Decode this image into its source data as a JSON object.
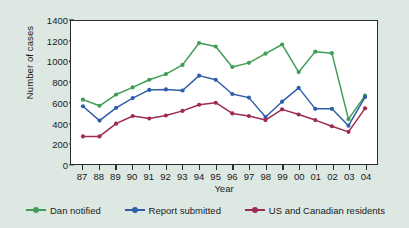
{
  "chart_data": {
    "type": "line",
    "title": "",
    "xlabel": "Year",
    "ylabel": "Number of cases",
    "categories": [
      "87",
      "88",
      "89",
      "90",
      "91",
      "92",
      "93",
      "94",
      "95",
      "96",
      "97",
      "98",
      "99",
      "00",
      "01",
      "02",
      "03",
      "04"
    ],
    "ylim": [
      0,
      1400
    ],
    "yticks": [
      0,
      200,
      400,
      600,
      800,
      1000,
      1200,
      1400
    ],
    "grid": false,
    "legend_position": "bottom",
    "series": [
      {
        "name": "Dan notified",
        "color": "#3f9d55",
        "values": [
          630,
          570,
          680,
          750,
          825,
          880,
          970,
          1185,
          1150,
          950,
          990,
          1080,
          1170,
          900,
          1100,
          1085,
          440,
          670
        ]
      },
      {
        "name": "Report submitted",
        "color": "#2f5fa8",
        "values": [
          565,
          425,
          550,
          645,
          725,
          730,
          720,
          865,
          825,
          685,
          650,
          460,
          610,
          745,
          540,
          540,
          375,
          655
        ]
      },
      {
        "name": "US and Canadian residents",
        "color": "#9e2a55",
        "values": [
          270,
          270,
          395,
          470,
          445,
          475,
          520,
          580,
          600,
          495,
          470,
          430,
          535,
          485,
          430,
          370,
          315,
          545
        ]
      }
    ]
  },
  "legend": {
    "items": [
      {
        "label": "Dan notified",
        "color": "#3f9d55"
      },
      {
        "label": "Report submitted",
        "color": "#2f5fa8"
      },
      {
        "label": "US and Canadian residents",
        "color": "#9e2a55"
      }
    ]
  },
  "axes": {
    "y_title": "Number of cases",
    "x_title": "Year"
  }
}
